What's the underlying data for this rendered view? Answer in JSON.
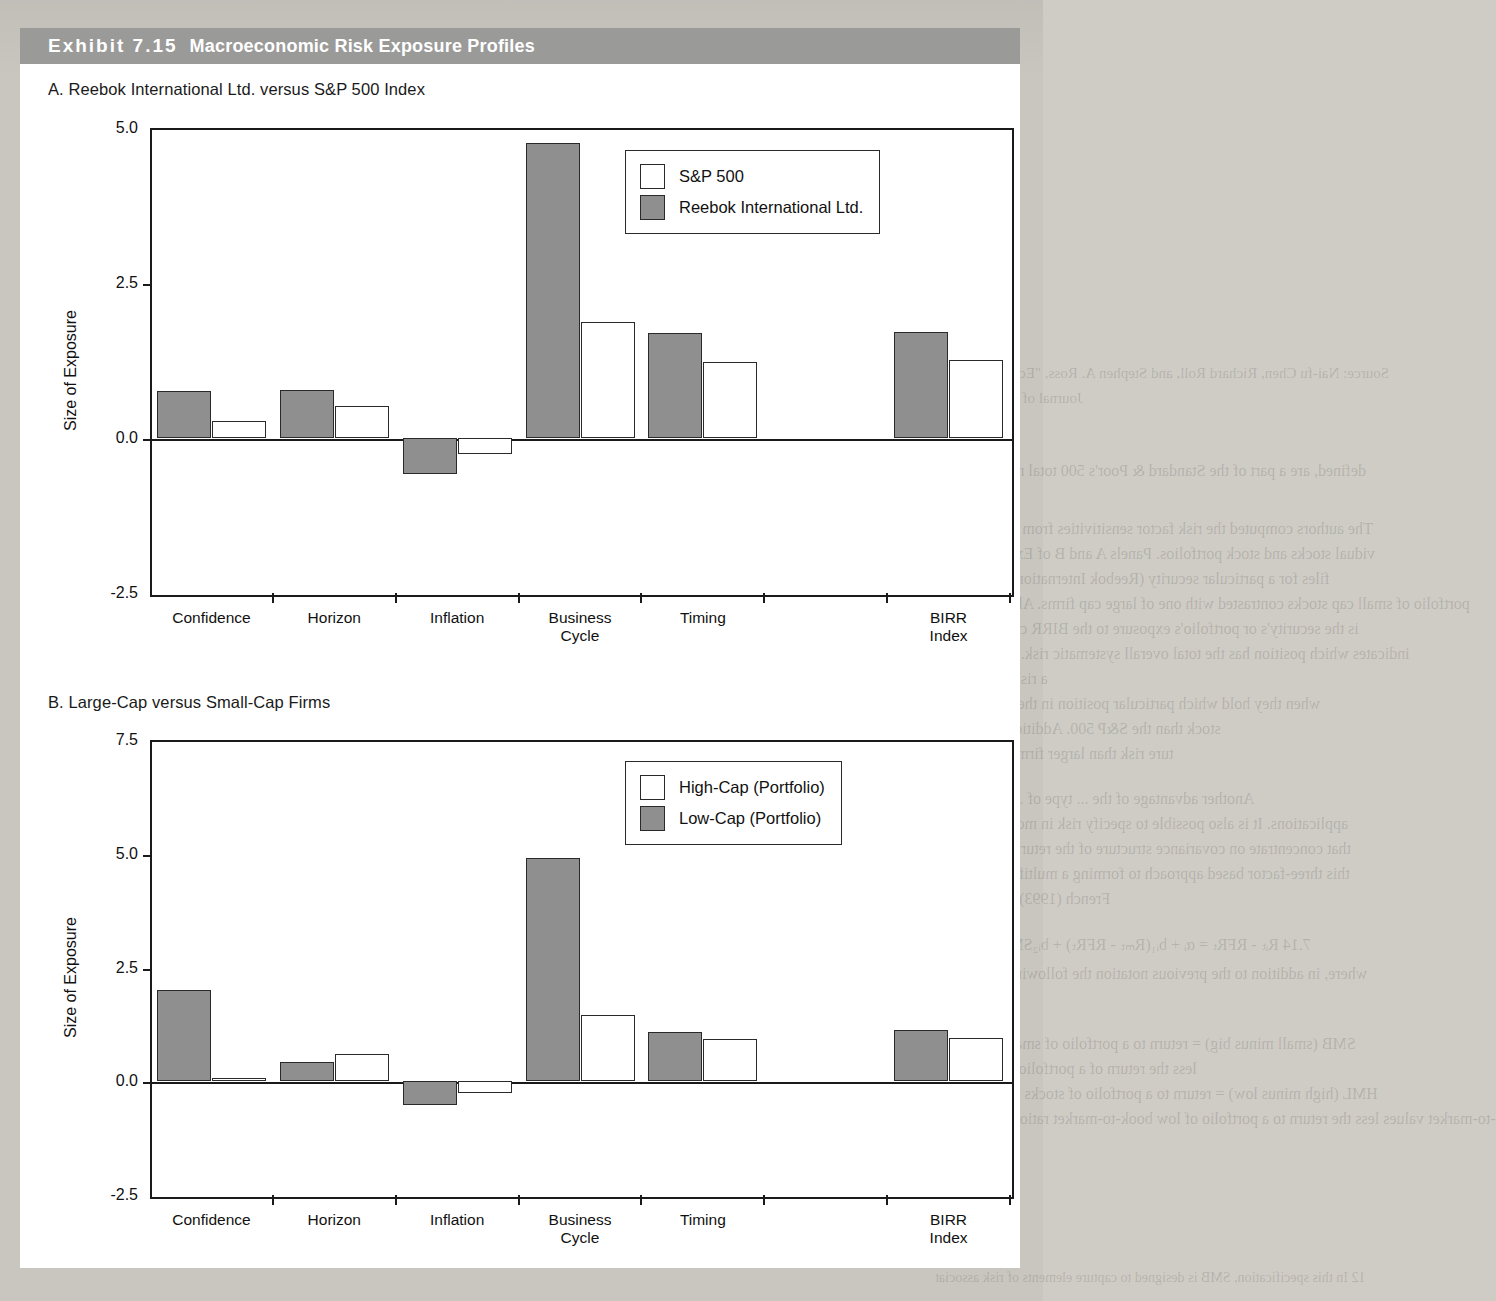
{
  "exhibit": {
    "number_label": "Exhibit 7.15",
    "title": "Macroeconomic Risk Exposure Profiles"
  },
  "panels": [
    {
      "id": "panel-a",
      "title": "A. Reebok International Ltd. versus S&P 500 Index",
      "legend": [
        {
          "label": "S&P 500",
          "fill": "white"
        },
        {
          "label": "Reebok International Ltd.",
          "fill": "gray"
        }
      ],
      "chart_data": {
        "type": "bar",
        "title": "A. Reebok International Ltd. versus S&P 500 Index",
        "xlabel": "",
        "ylabel": "Size of Exposure",
        "ylim": [
          -2.5,
          5.0
        ],
        "yticks": [
          "5.0",
          "2.5",
          "0.0",
          "-2.5"
        ],
        "ytick_values": [
          5.0,
          2.5,
          0.0,
          -2.5
        ],
        "grid": false,
        "legend_position": "upper-right",
        "categories": [
          "Confidence",
          "Horizon",
          "Inflation",
          "Business\nCycle",
          "Timing",
          "",
          "BIRR Index"
        ],
        "series": [
          {
            "name": "Reebok International Ltd.",
            "fill": "gray",
            "values": [
              0.76,
              0.78,
              -0.58,
              4.76,
              1.69,
              null,
              1.71
            ]
          },
          {
            "name": "S&P 500",
            "fill": "white",
            "values": [
              0.27,
              0.51,
              -0.26,
              1.87,
              1.23,
              null,
              1.26
            ]
          }
        ]
      }
    },
    {
      "id": "panel-b",
      "title": "B. Large-Cap versus Small-Cap Firms",
      "legend": [
        {
          "label": "High-Cap (Portfolio)",
          "fill": "white"
        },
        {
          "label": "Low-Cap (Portfolio)",
          "fill": "gray"
        }
      ],
      "chart_data": {
        "type": "bar",
        "title": "B. Large-Cap versus Small-Cap Firms",
        "xlabel": "",
        "ylabel": "Size of Exposure",
        "ylim": [
          -2.5,
          7.5
        ],
        "yticks": [
          "7.5",
          "5.0",
          "2.5",
          "0.0",
          "-2.5"
        ],
        "ytick_values": [
          7.5,
          5.0,
          2.5,
          0.0,
          -2.5
        ],
        "grid": false,
        "legend_position": "upper-right",
        "categories": [
          "Confidence",
          "Horizon",
          "Inflation",
          "Business\nCycle",
          "Timing",
          "",
          "BIRR Index"
        ],
        "series": [
          {
            "name": "Low-Cap (Portfolio)",
            "fill": "gray",
            "values": [
              2.0,
              0.42,
              -0.52,
              4.9,
              1.08,
              null,
              1.12
            ]
          },
          {
            "name": "High-Cap (Portfolio)",
            "fill": "white",
            "values": [
              0.08,
              0.6,
              -0.25,
              1.45,
              0.93,
              null,
              0.95
            ]
          }
        ]
      }
    }
  ],
  "bleed_text": [
    {
      "t": "Period",
      "x": 700,
      "y": 92,
      "s": 15
    },
    {
      "t": "Constant",
      "x": 560,
      "y": 92,
      "s": 15
    },
    {
      "t": "1958-1969",
      "x": 715,
      "y": 118,
      "s": 14
    },
    {
      "t": "10.24",
      "x": 595,
      "y": 118,
      "s": 14
    },
    {
      "t": "-2.40",
      "x": 500,
      "y": 118,
      "s": 14
    },
    {
      "t": "0.72",
      "x": 420,
      "y": 118,
      "s": 14
    },
    {
      "t": "-0.90",
      "x": 330,
      "y": 118,
      "s": 14
    },
    {
      "t": "(2.79)",
      "x": 595,
      "y": 140,
      "s": 14
    },
    {
      "t": "(-1.63)",
      "x": 500,
      "y": 140,
      "s": 14
    },
    {
      "t": "(3.98)",
      "x": 420,
      "y": 140,
      "s": 14
    },
    {
      "t": "(-1.26)",
      "x": 330,
      "y": 140,
      "s": 14
    },
    {
      "t": "6.52",
      "x": 595,
      "y": 162,
      "s": 14
    },
    {
      "t": "1.54",
      "x": 500,
      "y": 162,
      "s": 14
    },
    {
      "t": "12.69",
      "x": 420,
      "y": 162,
      "s": 14
    },
    {
      "t": "0.21",
      "x": 330,
      "y": 162,
      "s": 14
    },
    {
      "t": "(1.86)",
      "x": 595,
      "y": 184,
      "s": 14
    },
    {
      "t": "(0.28)",
      "x": 500,
      "y": 184,
      "s": 14
    },
    {
      "t": "(1.73)",
      "x": 420,
      "y": 184,
      "s": 14
    },
    {
      "t": "(0.02)",
      "x": 330,
      "y": 184,
      "s": 14
    },
    {
      "t": "8.56",
      "x": 595,
      "y": 206,
      "s": 14
    },
    {
      "t": "-5.27",
      "x": 500,
      "y": 206,
      "s": 14
    },
    {
      "t": "16.47",
      "x": 420,
      "y": 206,
      "s": 14
    },
    {
      "t": "-0.18",
      "x": 330,
      "y": 206,
      "s": 14
    },
    {
      "t": "(1.17)",
      "x": 595,
      "y": 228,
      "s": 14
    },
    {
      "t": "(-0.77)",
      "x": 500,
      "y": 228,
      "s": 14
    },
    {
      "t": "(3.04)",
      "x": 420,
      "y": 228,
      "s": 14
    },
    {
      "t": "(-3.24)",
      "x": 330,
      "y": 228,
      "s": 14
    },
    {
      "t": "1936-1984",
      "x": 715,
      "y": 280,
      "s": 14
    },
    {
      "t": "16.46",
      "x": 595,
      "y": 280,
      "s": 14
    },
    {
      "t": "-3.69",
      "x": 500,
      "y": 280,
      "s": 14
    },
    {
      "t": "8.40",
      "x": 420,
      "y": 280,
      "s": 14
    },
    {
      "t": "-0.12",
      "x": 330,
      "y": 280,
      "s": 14
    },
    {
      "t": "(3.24)",
      "x": 595,
      "y": 302,
      "s": 14
    },
    {
      "t": "(-1.23)",
      "x": 500,
      "y": 302,
      "s": 14
    },
    {
      "t": "(1.96)",
      "x": 420,
      "y": 302,
      "s": 14
    },
    {
      "t": "(-0.68)",
      "x": 330,
      "y": 302,
      "s": 14
    },
    {
      "t": "Source: Nai-fu Chen, Richard Roll, and Stephen A. Ross, \"Economic Forces and",
      "x": 905,
      "y": 365,
      "s": 15
    },
    {
      "t": "Journal of Business 59, no. 3 (April 1986)",
      "x": 830,
      "y": 390,
      "s": 15
    },
    {
      "t": "defined, are a part of the Standard & Poor's 500 total return that is not ex",
      "x": 900,
      "y": 462,
      "s": 16
    },
    {
      "t": "four macroeconomic factors.",
      "x": 540,
      "y": 490,
      "s": 16
    },
    {
      "t": "The authors computed the risk factor sensitivities from their model for se",
      "x": 905,
      "y": 520,
      "s": 16
    },
    {
      "t": "vidual stocks and stock portfolios. Panels A and B of Exhibit 7.15 show th",
      "x": 900,
      "y": 545,
      "s": 16
    },
    {
      "t": "files for a particular security (Reebok International) and for the S&P 5",
      "x": 880,
      "y": 570,
      "s": 16
    },
    {
      "t": "portfolio of small cap stocks contrasted with one of large cap firms. Also includ",
      "x": 960,
      "y": 595,
      "s": 16
    },
    {
      "t": "is the security's or portfolio's exposure to the BIRR composite risk index,",
      "x": 890,
      "y": 620,
      "s": 16
    },
    {
      "t": "indicates which position has the total overall systematic risk. These out put",
      "x": 930,
      "y": 645,
      "s": 16
    },
    {
      "t": "a risk factor model can help investors differentiate ...",
      "x": 710,
      "y": 670,
      "s": 16
    },
    {
      "t": "when they hold which particular position in their portfolios. Note for",
      "x": 880,
      "y": 695,
      "s": 16
    },
    {
      "t": "stock than the S&P 500. Additionally, smaller firms are more",
      "x": 830,
      "y": 720,
      "s": 16
    },
    {
      "t": "ture risk than larger firms but less exposed to horizon risk.",
      "x": 800,
      "y": 745,
      "s": 16
    },
    {
      "t": "Another advantage of the ... type of ... model is ... to ... mu",
      "x": 880,
      "y": 790,
      "s": 16
    },
    {
      "t": "applications. It is also possible to specify risk in more concrete terms th",
      "x": 890,
      "y": 815,
      "s": 16
    },
    {
      "t": "that concentrate on covariance structure of the returns being employed",
      "x": 900,
      "y": 840,
      "s": 16
    },
    {
      "t": "this three-factor based approach to forming a multifactor model is that",
      "x": 900,
      "y": 865,
      "s": 16
    },
    {
      "t": "French (1993), who use the following functional form:",
      "x": 760,
      "y": 890,
      "s": 16
    },
    {
      "t": "7.14   Rᵢₜ - RFRₜ = αᵢ + bᵢ₁(Rₘₜ - RFRₜ) + bᵢ₂SMBₜ + bᵢ₃HMLₜ",
      "x": 920,
      "y": 935,
      "s": 16
    },
    {
      "t": "where, in addition to the previous notation the following two additional",
      "x": 910,
      "y": 965,
      "s": 16
    },
    {
      "t": "les are defined:",
      "x": 480,
      "y": 990,
      "s": 16
    },
    {
      "t": "SMB (small minus big) = return to a portfolio of small-capitalization st",
      "x": 900,
      "y": 1035,
      "s": 16
    },
    {
      "t": "less the return of a portfolio of large-capitalization stocks",
      "x": 830,
      "y": 1060,
      "s": 16
    },
    {
      "t": "HML (high minus low) = return to a portfolio of stocks with high ratios",
      "x": 920,
      "y": 1085,
      "s": 16
    },
    {
      "t": "-to-market values less the return to a portfolio of low book-to-market ratio stoc",
      "x": 990,
      "y": 1110,
      "s": 16
    },
    {
      "t": "12 In this specification, SMB is designed to capture elements of risk associat",
      "x": 935,
      "y": 1270,
      "s": 14
    }
  ]
}
